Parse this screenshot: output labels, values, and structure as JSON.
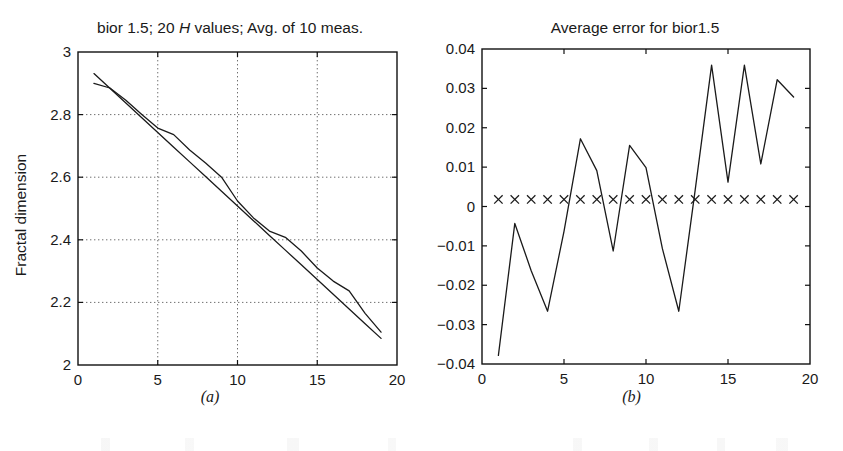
{
  "figure": {
    "caption_a": "(a)",
    "caption_b": "(b)"
  },
  "chart_data": [
    {
      "panel": "a",
      "type": "line",
      "title": "bior 1.5; 20 H values; Avg. of 10 meas.",
      "title_parts": [
        "bior 1.5; 20 ",
        "H",
        " values; Avg. of 10 meas."
      ],
      "xlabel": "",
      "ylabel": "Fractal dimension",
      "xlim": [
        0,
        20
      ],
      "ylim": [
        2,
        3
      ],
      "xticks": [
        0,
        5,
        10,
        15,
        20
      ],
      "xticklabels": [
        "0",
        "5",
        "10",
        "15",
        "20"
      ],
      "yticks": [
        2,
        2.2,
        2.4,
        2.6,
        2.8,
        3
      ],
      "yticklabels": [
        "2",
        "2.2",
        "2.4",
        "2.6",
        "2.8",
        "3"
      ],
      "grid": true,
      "legend": "none",
      "x": [
        1,
        2,
        3,
        4,
        5,
        6,
        7,
        8,
        9,
        10,
        11,
        12,
        13,
        14,
        15,
        16,
        17,
        18,
        19
      ],
      "series": [
        {
          "name": "theoretical",
          "values": [
            2.931,
            2.884,
            2.837,
            2.79,
            2.743,
            2.696,
            2.649,
            2.602,
            2.555,
            2.508,
            2.461,
            2.414,
            2.367,
            2.32,
            2.273,
            2.226,
            2.179,
            2.132,
            2.085
          ]
        },
        {
          "name": "measured",
          "values": [
            2.9,
            2.885,
            2.846,
            2.8,
            2.757,
            2.736,
            2.687,
            2.645,
            2.6,
            2.524,
            2.47,
            2.428,
            2.408,
            2.364,
            2.31,
            2.268,
            2.237,
            2.165,
            2.105
          ]
        }
      ]
    },
    {
      "panel": "b",
      "type": "line",
      "title": "Average error for bior1.5",
      "xlabel": "",
      "ylabel": "",
      "xlim": [
        0,
        20
      ],
      "ylim": [
        -0.04,
        0.04
      ],
      "xticks": [
        0,
        5,
        10,
        15,
        20
      ],
      "xticklabels": [
        "0",
        "5",
        "10",
        "15",
        "20"
      ],
      "yticks": [
        -0.04,
        -0.03,
        -0.02,
        -0.01,
        0,
        0.01,
        0.02,
        0.03,
        0.04
      ],
      "yticklabels": [
        "-0.04",
        "-0.03",
        "-0.02",
        "-0.01",
        "0",
        "0.01",
        "0.02",
        "0.03",
        "0.04"
      ],
      "grid": false,
      "legend": "none",
      "x": [
        1,
        2,
        3,
        4,
        5,
        6,
        7,
        8,
        9,
        10,
        11,
        12,
        13,
        14,
        15,
        16,
        17,
        18,
        19
      ],
      "series": [
        {
          "name": "average error",
          "values": [
            -0.0378,
            -0.0043,
            -0.0163,
            -0.0266,
            -0.0063,
            0.0172,
            0.0091,
            -0.0113,
            0.0155,
            0.0099,
            -0.0107,
            -0.0266,
            0.0042,
            0.0359,
            0.0062,
            0.0359,
            0.0108,
            0.0322,
            0.0278
          ]
        },
        {
          "name": "zero reference markers",
          "marker": "x",
          "values": [
            0.0018,
            0.0018,
            0.0018,
            0.0018,
            0.0018,
            0.0018,
            0.0018,
            0.0018,
            0.0018,
            0.0018,
            0.0018,
            0.0018,
            0.0018,
            0.0018,
            0.0018,
            0.0018,
            0.0018,
            0.0018,
            0.0018
          ]
        }
      ]
    }
  ]
}
